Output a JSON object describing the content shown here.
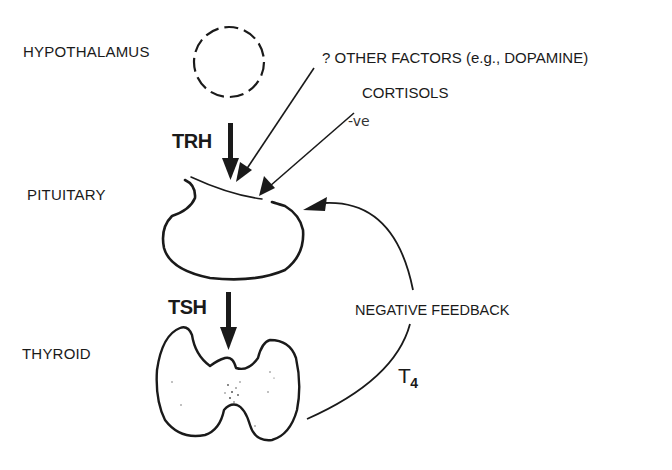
{
  "diagram": {
    "organs": {
      "hypothalamus": "HYPOTHALAMUS",
      "pituitary": "PITUITARY",
      "thyroid": "THYROID"
    },
    "hormones": {
      "trh": "TRH",
      "tsh": "TSH",
      "t4_base": "T",
      "t4_sub": "4"
    },
    "modulators": {
      "other_factors": "? OTHER FACTORS (e.g., DOPAMINE)",
      "cortisols": "CORTISOLS",
      "cortisols_effect": "-ve"
    },
    "feedback": {
      "label": "NEGATIVE FEEDBACK"
    },
    "colors": {
      "ink": "#1a1a1a",
      "background": "#ffffff"
    }
  }
}
